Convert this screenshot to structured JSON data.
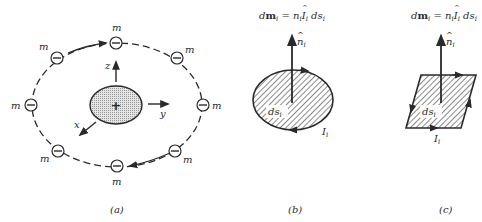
{
  "panel_a": {
    "caption": "(a)",
    "electron_label": "m",
    "electron_symbol": "−",
    "nucleus_symbol": "+",
    "axes": {
      "z": "z",
      "y": "y",
      "x": "x"
    }
  },
  "panel_b": {
    "caption": "(b)",
    "equation": {
      "d": "d",
      "m": "m",
      "i": "i",
      "eq": " = ",
      "n": "n",
      "I": "I",
      "ds": " ds"
    },
    "normal_label": "n",
    "normal_sub": "i",
    "area_label": "ds",
    "area_sub": "i",
    "current_label": "I",
    "current_sub": "i"
  },
  "panel_c": {
    "caption": "(c)",
    "equation": {
      "d": "d",
      "m": "m",
      "i": "i",
      "eq": " = ",
      "n": "n",
      "I": "I",
      "ds": " ds"
    },
    "normal_label": "n",
    "normal_sub": "i",
    "area_label": "ds",
    "area_sub": "i",
    "current_label": "I",
    "current_sub": "i"
  },
  "colors": {
    "ink": "#2a2a2a",
    "nucleus_fill": "#cfcfcf"
  }
}
